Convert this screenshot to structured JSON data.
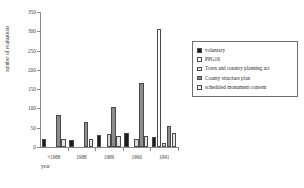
{
  "chart_data": {
    "type": "bar",
    "title": "",
    "xlabel": "year",
    "ylabel": "number of evaluations",
    "categories": [
      "<1988",
      "1988",
      "1989",
      "1990",
      "1991"
    ],
    "ylim": [
      0,
      350
    ],
    "yticks": [
      0,
      50,
      100,
      150,
      200,
      250,
      300,
      350
    ],
    "ytick_labels": [
      "0",
      "50",
      "100",
      "150",
      "200",
      "250",
      "300",
      "350"
    ],
    "grid": false,
    "legend_position": "right",
    "series": [
      {
        "name": "voluntary",
        "color": "#1c1c1c",
        "values": [
          22,
          18,
          31,
          36,
          27
        ]
      },
      {
        "name": "PPG16",
        "color": "#ffffff",
        "values": [
          0,
          0,
          0,
          0,
          307
        ]
      },
      {
        "name": "Town and country planning act",
        "color": "#d9d9d9",
        "values": [
          0,
          0,
          33,
          20,
          10
        ]
      },
      {
        "name": "County structure plan",
        "color": "#8c8c8c",
        "values": [
          82,
          64,
          105,
          165,
          54
        ]
      },
      {
        "name": "scheduled monument consent",
        "color": "#e6e6e6",
        "values": [
          20,
          20,
          28,
          29,
          37
        ]
      }
    ]
  },
  "legend": {
    "entries": [
      {
        "label": "voluntary",
        "color": "#1c1c1c"
      },
      {
        "label": "PPG16",
        "color": "#ffffff"
      },
      {
        "label": "Town and country planning act",
        "color": "#ededed"
      },
      {
        "label": "County structure plan",
        "color": "#8c8c8c"
      },
      {
        "label": "scheduled monument consent",
        "color": "#f2f2f2"
      }
    ]
  },
  "axes": {
    "x_title": "year",
    "y_title": "number of evaluations"
  }
}
